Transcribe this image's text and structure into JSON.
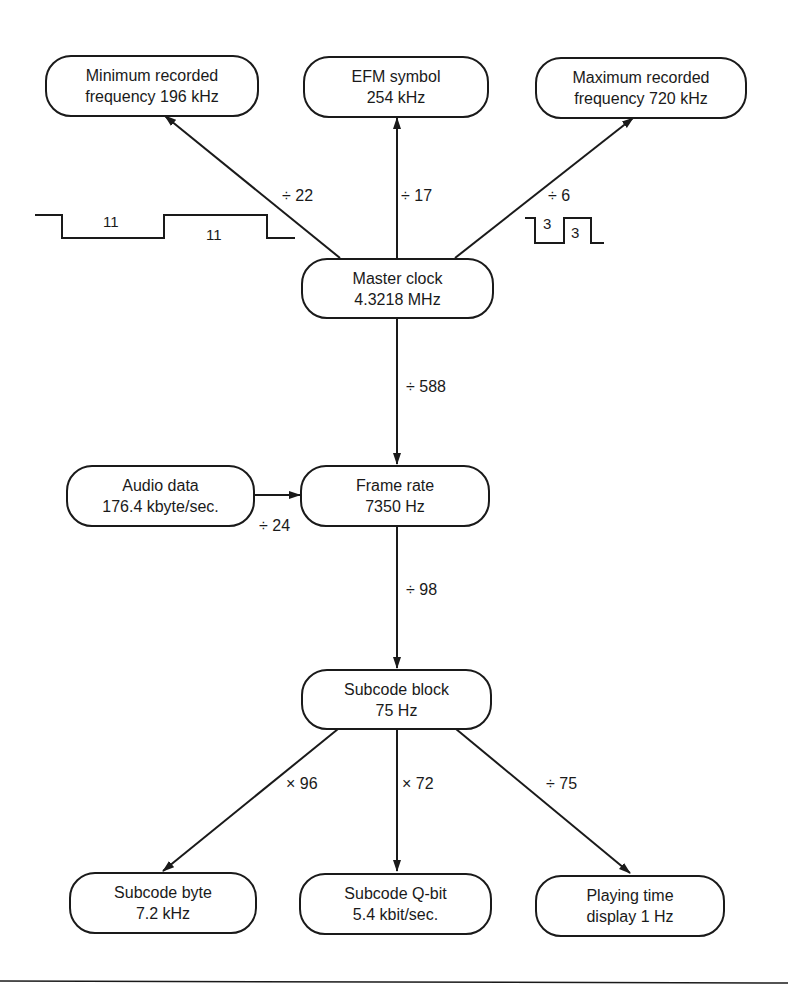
{
  "nodes": {
    "min_freq": {
      "line1": "Minimum recorded",
      "line2": "frequency 196 kHz"
    },
    "efm_symbol": {
      "line1": "EFM symbol",
      "line2": "254 kHz"
    },
    "max_freq": {
      "line1": "Maximum recorded",
      "line2": "frequency 720 kHz"
    },
    "master_clock": {
      "line1": "Master clock",
      "line2": "4.3218 MHz"
    },
    "audio_data": {
      "line1": "Audio data",
      "line2": "176.4 kbyte/sec."
    },
    "frame_rate": {
      "line1": "Frame rate",
      "line2": "7350 Hz"
    },
    "subcode_block": {
      "line1": "Subcode block",
      "line2": "75 Hz"
    },
    "subcode_byte": {
      "line1": "Subcode byte",
      "line2": "7.2 kHz"
    },
    "subcode_qbit": {
      "line1": "Subcode Q-bit",
      "line2": "5.4 kbit/sec."
    },
    "playing_time": {
      "line1": "Playing time",
      "line2": "display 1 Hz"
    }
  },
  "edges": {
    "to_min_freq": "÷ 22",
    "to_efm_symbol": "÷ 17",
    "to_max_freq": "÷ 6",
    "master_to_frame": "÷ 588",
    "audio_to_frame": "÷ 24",
    "frame_to_subcode": "÷ 98",
    "to_subcode_byte": "× 96",
    "to_subcode_qbit": "× 72",
    "to_playing_time": "÷ 75"
  },
  "waveforms": {
    "long": {
      "pulse1": "11",
      "pulse2": "11"
    },
    "short": {
      "pulse1": "3",
      "pulse2": "3"
    }
  }
}
